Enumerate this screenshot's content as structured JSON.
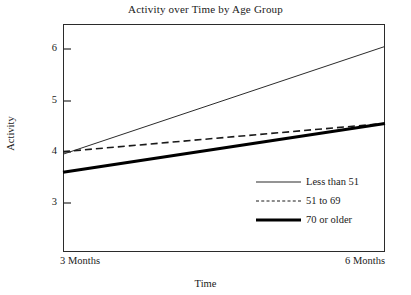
{
  "chart_data": {
    "type": "line",
    "title": "Activity over Time by Age Group",
    "xlabel": "Time",
    "ylabel": "Activity",
    "categories": [
      "3 Months",
      "6 Months"
    ],
    "x": [
      3,
      6
    ],
    "xlim": [
      3,
      6
    ],
    "ylim": [
      2.4,
      6.45
    ],
    "yticks": [
      3,
      4,
      5,
      6
    ],
    "ytick_labels": [
      "3",
      "4",
      "5",
      "6"
    ],
    "xtick_labels": [
      "3 Months",
      "6 Months"
    ],
    "grid": false,
    "legend_position": "inside-lower-right",
    "series": [
      {
        "name": "Less than 51",
        "style": "thin-solid",
        "color": "#2b2b2b",
        "values": [
          3.95,
          6.05
        ]
      },
      {
        "name": "51 to 69",
        "style": "dashed",
        "color": "#1a1a1a",
        "values": [
          4.0,
          4.55
        ]
      },
      {
        "name": "70 or older",
        "style": "thick-solid",
        "color": "#000000",
        "values": [
          3.6,
          4.55
        ]
      }
    ]
  },
  "chart": {
    "title": "Activity over Time by Age Group",
    "axes": {
      "ylabel": "Activity",
      "xlabel": "Time",
      "ytick_labels": [
        "6",
        "5",
        "4",
        "3"
      ],
      "xtick_left": "3 Months",
      "xtick_right": "6 Months"
    },
    "legend": {
      "items": [
        {
          "label": "Less than 51"
        },
        {
          "label": "51 to 69"
        },
        {
          "label": "70 or older"
        }
      ]
    }
  }
}
